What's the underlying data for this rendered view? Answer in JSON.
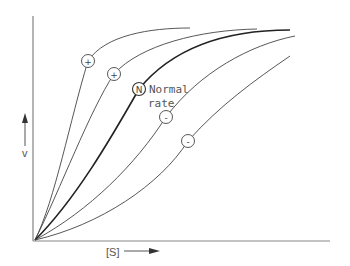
{
  "diagram": {
    "title": "",
    "y_axis": {
      "label": "v",
      "arrow": "up-arrow"
    },
    "x_axis": {
      "label": "[S]",
      "arrow": "right-arrow"
    },
    "annotation": {
      "line1": "Normal",
      "line2": "rate"
    },
    "curves": [
      {
        "id": "curve-activated-1",
        "marker": "+",
        "weight": "thin"
      },
      {
        "id": "curve-activated-2",
        "marker": "+",
        "weight": "thin"
      },
      {
        "id": "curve-normal",
        "marker": "N",
        "weight": "bold"
      },
      {
        "id": "curve-inhibited-1",
        "marker": "-",
        "weight": "thin"
      },
      {
        "id": "curve-inhibited-2",
        "marker": "-",
        "weight": "thin"
      }
    ],
    "colors": {
      "line": "#333333",
      "axis": "#777777",
      "text": "#555555",
      "background": "#ffffff"
    }
  }
}
